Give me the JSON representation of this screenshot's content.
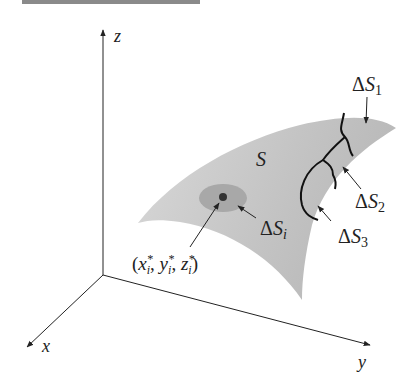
{
  "figure": {
    "axes": {
      "z": "z",
      "x": "x",
      "y": "y"
    },
    "surface_label": "S",
    "regions": [
      {
        "delta": "Δ",
        "name": "S",
        "sub": "1"
      },
      {
        "delta": "Δ",
        "name": "S",
        "sub": "2"
      },
      {
        "delta": "Δ",
        "name": "S",
        "sub": "3"
      },
      {
        "delta": "Δ",
        "name": "S",
        "sub": "i"
      }
    ],
    "sample_point": {
      "open": "(",
      "x": "x",
      "y": "y",
      "z": "z",
      "sub": "i",
      "star": "*",
      "sep": ", ",
      "close": ")"
    },
    "colors": {
      "surface": "#c8c8c8",
      "patch": "#a8a8a8",
      "point": "#333333",
      "ink": "#222222",
      "topbar": "#8a8a8a"
    }
  }
}
